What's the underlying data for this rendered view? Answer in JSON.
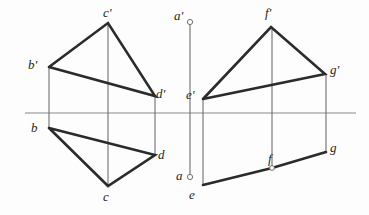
{
  "figure": {
    "type": "descriptive-geometry-diagram",
    "canvas": {
      "width": 369,
      "height": 215
    },
    "colors": {
      "background": "#fdfdfd",
      "object_line": "#2b2b2b",
      "thin_line": "#6f6f6f",
      "axis_line": "#8a8a8a",
      "label_text": "#1d1d1d"
    },
    "ground_line": {
      "name": "horizontal-projection-axis",
      "x1": 25,
      "y1": 113,
      "x2": 356,
      "y2": 113
    },
    "vertical_axis": {
      "name": "vertical-projection-axis",
      "x": 190,
      "y_top": 22,
      "y_bottom": 177,
      "endpoint_markers": [
        {
          "label": "a'",
          "cx": 190,
          "cy": 22,
          "r": 2.6
        },
        {
          "label": "a",
          "cx": 190,
          "cy": 177,
          "r": 2.6
        }
      ]
    },
    "vertices": {
      "b_prime": {
        "x": 49,
        "y": 67
      },
      "c_prime": {
        "x": 108,
        "y": 23
      },
      "d_prime": {
        "x": 155,
        "y": 96
      },
      "b": {
        "x": 49,
        "y": 128
      },
      "c": {
        "x": 108,
        "y": 186
      },
      "d": {
        "x": 155,
        "y": 155
      },
      "e_prime": {
        "x": 203,
        "y": 99
      },
      "f_prime": {
        "x": 271,
        "y": 27
      },
      "g_prime": {
        "x": 325,
        "y": 74
      },
      "e": {
        "x": 203,
        "y": 185
      },
      "f": {
        "x": 272,
        "y": 168
      },
      "g": {
        "x": 326,
        "y": 152
      }
    },
    "object_polylines": [
      {
        "name": "front-view-triangle-bcd",
        "points": "49,67 108,23 155,96 49,67"
      },
      {
        "name": "top-view-triangle-bcd",
        "points": "49,128 108,186 155,155 49,128"
      },
      {
        "name": "front-view-triangle-efg",
        "points": "203,99 271,27 325,74 203,99"
      },
      {
        "name": "top-view-line-efg",
        "points": "203,185 272,168 326,152"
      }
    ],
    "projector_lines": [
      {
        "name": "projector-b",
        "x": 49,
        "y1": 67,
        "y2": 128
      },
      {
        "name": "projector-c",
        "x": 108,
        "y1": 23,
        "y2": 186
      },
      {
        "name": "projector-d",
        "x": 155,
        "y1": 96,
        "y2": 155
      },
      {
        "name": "projector-e",
        "x": 203,
        "y1": 99,
        "y2": 185
      },
      {
        "name": "projector-f",
        "x": 272,
        "y1": 27,
        "y2": 168
      },
      {
        "name": "projector-g",
        "x": 326,
        "y1": 74,
        "y2": 152
      }
    ],
    "point_markers": [
      {
        "name": "point-marker-f",
        "cx": 272,
        "cy": 168,
        "r": 2.4
      }
    ],
    "labels": [
      {
        "id": "b_prime",
        "text": "b'",
        "x": 28,
        "y": 58
      },
      {
        "id": "c_prime",
        "text": "c'",
        "x": 103,
        "y": 6
      },
      {
        "id": "d_prime",
        "text": "d'",
        "x": 156,
        "y": 87
      },
      {
        "id": "b",
        "text": "b",
        "x": 31,
        "y": 121
      },
      {
        "id": "c",
        "text": "c",
        "x": 103,
        "y": 190
      },
      {
        "id": "d",
        "text": "d",
        "x": 158,
        "y": 148
      },
      {
        "id": "a_prime",
        "text": "a'",
        "x": 174,
        "y": 9
      },
      {
        "id": "a",
        "text": "a",
        "x": 176,
        "y": 169
      },
      {
        "id": "e_prime",
        "text": "e'",
        "x": 186,
        "y": 88
      },
      {
        "id": "f_prime",
        "text": "f'",
        "x": 265,
        "y": 6
      },
      {
        "id": "g_prime",
        "text": "g'",
        "x": 330,
        "y": 63
      },
      {
        "id": "e",
        "text": "e",
        "x": 189,
        "y": 188
      },
      {
        "id": "f",
        "text": "f",
        "x": 268,
        "y": 152
      },
      {
        "id": "g",
        "text": "g",
        "x": 330,
        "y": 141
      }
    ]
  }
}
